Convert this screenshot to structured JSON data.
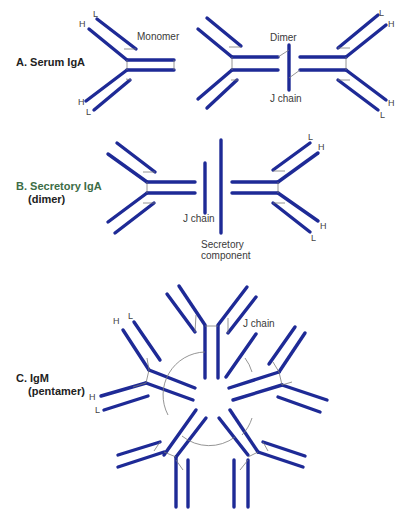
{
  "colors": {
    "chain": "#1e2a96",
    "link": "#7a7a7a",
    "text": "#333333",
    "sectionB": "#3c6d46"
  },
  "sections": {
    "a": {
      "title": "A. Serum IgA",
      "monomer_label": "Monomer",
      "dimer_label": "Dimer",
      "jchain_label": "J chain"
    },
    "b": {
      "title": "B. Secretory IgA",
      "subtitle": "(dimer)",
      "jchain_label": "J chain",
      "secretory_label_1": "Secretory",
      "secretory_label_2": "component"
    },
    "c": {
      "title": "C. IgM",
      "subtitle": "(pentamer)",
      "jchain_label": "J chain"
    }
  },
  "chain_labels": {
    "heavy": "H",
    "light": "L"
  }
}
